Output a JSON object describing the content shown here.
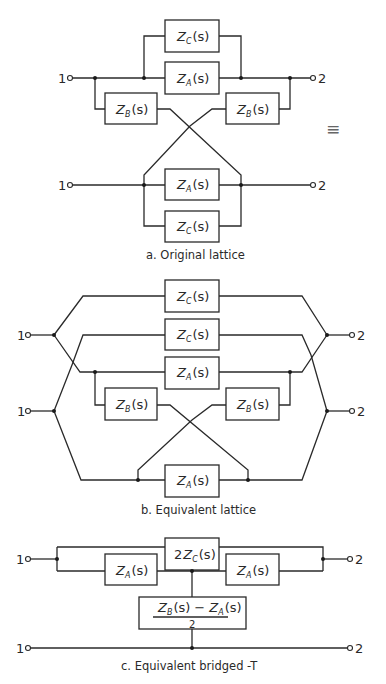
{
  "figure": {
    "equivalence_symbol": "≡",
    "terminals": {
      "input": "1",
      "output": "2"
    },
    "sections": [
      {
        "id": "a",
        "caption": "a. Original lattice",
        "boxes": [
          {
            "label_main": "Z",
            "label_sub": "C",
            "label_arg": "(s)"
          },
          {
            "label_main": "Z",
            "label_sub": "A",
            "label_arg": "(s)"
          },
          {
            "label_main": "Z",
            "label_sub": "B",
            "label_arg": "(s)"
          },
          {
            "label_main": "Z",
            "label_sub": "B",
            "label_arg": "(s)"
          },
          {
            "label_main": "Z",
            "label_sub": "A",
            "label_arg": "(s)"
          },
          {
            "label_main": "Z",
            "label_sub": "C",
            "label_arg": "(s)"
          }
        ]
      },
      {
        "id": "b",
        "caption": "b. Equivalent lattice",
        "boxes": [
          {
            "label_main": "Z",
            "label_sub": "C",
            "label_arg": "(s)"
          },
          {
            "label_main": "Z",
            "label_sub": "C",
            "label_arg": "(s)"
          },
          {
            "label_main": "Z",
            "label_sub": "A",
            "label_arg": "(s)"
          },
          {
            "label_main": "Z",
            "label_sub": "B",
            "label_arg": "(s)"
          },
          {
            "label_main": "Z",
            "label_sub": "B",
            "label_arg": "(s)"
          },
          {
            "label_main": "Z",
            "label_sub": "A",
            "label_arg": "(s)"
          }
        ]
      },
      {
        "id": "c",
        "caption": "c. Equivalent bridged -T",
        "boxes": [
          {
            "label_prefix": "2",
            "label_main": "Z",
            "label_sub": "C",
            "label_arg": "(s)"
          },
          {
            "label_main": "Z",
            "label_sub": "A",
            "label_arg": "(s)"
          },
          {
            "label_main": "Z",
            "label_sub": "A",
            "label_arg": "(s)"
          }
        ],
        "fraction_box": {
          "numerator": {
            "t1_main": "Z",
            "t1_sub": "B",
            "t1_arg": "(s)",
            "op": "−",
            "t2_main": "Z",
            "t2_sub": "A",
            "t2_arg": "(s)"
          },
          "denominator": "2"
        }
      }
    ]
  }
}
